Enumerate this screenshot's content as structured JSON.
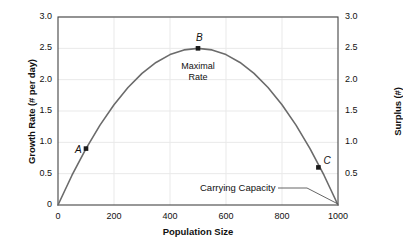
{
  "chart_data": {
    "type": "line",
    "title": "",
    "xlabel": "Population Size",
    "ylabel": "Growth Rate (# per day)",
    "ylabel_right": "Surplus (#)",
    "xlim": [
      0,
      1000
    ],
    "ylim": [
      0,
      3.0
    ],
    "grid": true,
    "legend": "none",
    "xticks": [
      "0",
      "200",
      "400",
      "600",
      "800",
      "1000"
    ],
    "xtick_values": [
      0,
      200,
      400,
      600,
      800,
      1000
    ],
    "yticks": [
      "0",
      "0.5",
      "1.0",
      "1.5",
      "2.0",
      "2.5",
      "3.0"
    ],
    "ytick_values": [
      0,
      0.5,
      1.0,
      1.5,
      2.0,
      2.5,
      3.0
    ],
    "yticks_right": [
      "0.5",
      "1.0",
      "1.5",
      "2.0",
      "2.5",
      "3.0"
    ],
    "ytick_right_values": [
      0.5,
      1.0,
      1.5,
      2.0,
      2.5,
      3.0
    ],
    "series": [
      {
        "name": "Logistic growth rate",
        "color": "#6b6b6b",
        "x": [
          0,
          50,
          100,
          150,
          200,
          250,
          300,
          350,
          400,
          450,
          500,
          550,
          600,
          650,
          700,
          750,
          800,
          850,
          900,
          950,
          1000
        ],
        "values": [
          0,
          0.475,
          0.9,
          1.275,
          1.6,
          1.875,
          2.1,
          2.275,
          2.4,
          2.475,
          2.5,
          2.475,
          2.4,
          2.275,
          2.1,
          1.875,
          1.6,
          1.275,
          0.9,
          0.475,
          0
        ]
      }
    ],
    "points": [
      {
        "label": "A",
        "x": 100,
        "y": 0.9,
        "label_dx": -11,
        "label_dy": -5
      },
      {
        "label": "B",
        "x": 500,
        "y": 2.5,
        "label_dx": -2,
        "label_dy": -16
      },
      {
        "label": "C",
        "x": 930,
        "y": 0.6,
        "label_dx": 5,
        "label_dy": -12
      }
    ],
    "annotations": [
      {
        "name": "maximal-rate",
        "text_line1": "Maximal",
        "text_line2": "Rate",
        "x": 500,
        "y": 2.27
      },
      {
        "name": "carrying-capacity",
        "text": "Carrying Capacity",
        "x": 1000,
        "y": 0
      }
    ]
  },
  "colors": {
    "curve": "#6b6b6b",
    "axis": "#444444",
    "grid": "#e9e9e9",
    "marker": "#1a1a1a",
    "text": "#111111",
    "background": "#ffffff"
  }
}
